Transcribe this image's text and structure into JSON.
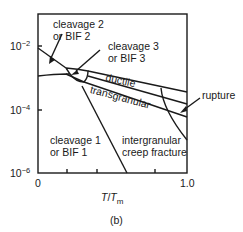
{
  "diagram": {
    "type": "fracture-mechanism-map",
    "caption": "(b)",
    "x_axis": {
      "label_T": "T",
      "label_slash": "/",
      "label_Tm": "T",
      "label_sub": "m",
      "ticks": [
        "0",
        "1.0"
      ]
    },
    "y_axis": {
      "ticks": [
        {
          "base": "10",
          "exp": "−2"
        },
        {
          "base": "10",
          "exp": "−4"
        },
        {
          "base": "10",
          "exp": "−6"
        }
      ]
    },
    "regions": {
      "cleavage2": {
        "line1": "cleavage 2",
        "line2": "or BIF 2"
      },
      "cleavage3": {
        "line1": "cleavage 3",
        "line2": "or BIF 3"
      },
      "cleavage1": {
        "line1": "cleavage 1",
        "line2": "or BIF 1"
      },
      "ductile": "ductile",
      "transgranular": "transgranular",
      "intergranular": {
        "line1": "intergranular",
        "line2": "creep fracture"
      },
      "rupture": "rupture"
    },
    "colors": {
      "ink": "#1a1a1a",
      "background": "#ffffff"
    }
  }
}
